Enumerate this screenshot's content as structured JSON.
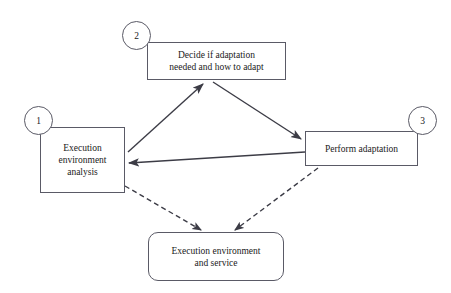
{
  "diagram": {
    "background_color": "#ffffff",
    "stroke_color": "#3c3c46",
    "text_color": "#1a1a1a",
    "nodes": [
      {
        "id": "env-analysis",
        "number": "1",
        "label": "Execution\nenvironment\nanalysis",
        "shape": "rectangle"
      },
      {
        "id": "decide",
        "number": "2",
        "label": "Decide if adaptation\nneeded and how to adapt",
        "shape": "rectangle"
      },
      {
        "id": "perform",
        "number": "3",
        "label": "Perform adaptation",
        "shape": "rectangle"
      },
      {
        "id": "env-service",
        "number": "",
        "label": "Execution environment\nand service",
        "shape": "rounded-rectangle"
      }
    ],
    "edges": [
      {
        "id": "analysis-to-decide",
        "from": "env-analysis",
        "to": "decide",
        "style": "solid",
        "arrow": "end"
      },
      {
        "id": "decide-to-perform",
        "from": "decide",
        "to": "perform",
        "style": "solid",
        "arrow": "end"
      },
      {
        "id": "perform-to-analysis",
        "from": "perform",
        "to": "env-analysis",
        "style": "solid",
        "arrow": "end"
      },
      {
        "id": "analysis-to-service",
        "from": "env-analysis",
        "to": "env-service",
        "style": "dashed",
        "arrow": "end"
      },
      {
        "id": "perform-to-service",
        "from": "perform",
        "to": "env-service",
        "style": "dashed",
        "arrow": "end"
      }
    ]
  }
}
